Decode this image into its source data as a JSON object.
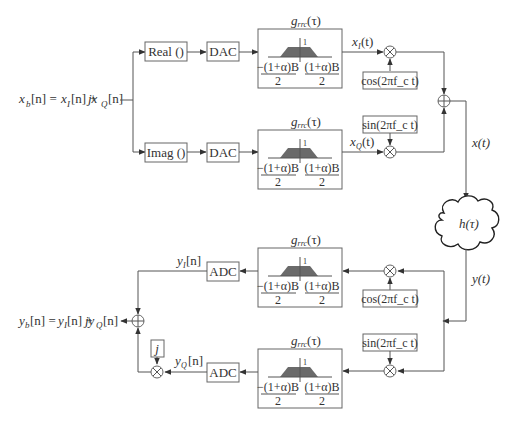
{
  "diagram": {
    "transmitter": {
      "input_label": "x_b[n] = x_I[n] + jx_Q[n]",
      "input_parts": {
        "main": "x",
        "sub_b": "b",
        "eq": "[n] = ",
        "xI": "x",
        "sub_I": "I",
        "mid": "[n] + ",
        "j": "jx",
        "sub_Q": "Q",
        "end": "[n]"
      },
      "real_block": "Real ()",
      "imag_block": "Imag ()",
      "dac_label": "DAC",
      "filter_title": "g_rrc(τ)",
      "filter_title_parts": {
        "g": "g",
        "sub": "rrc",
        "arg": "(τ)"
      },
      "filter_peak": "1",
      "filter_left_num": "−(1+α)B",
      "filter_right_num": "(1+α)B",
      "filter_den": "2",
      "xI_label": "x_I(t)",
      "xQ_label": "x_Q(t)",
      "cos_block": "cos(2πf_c t)",
      "sin_block": "sin(2πf_c t)",
      "output_label": "x(t)"
    },
    "channel": {
      "label": "h(τ)"
    },
    "receiver": {
      "input_label": "y(t)",
      "cos_block": "cos(2πf_c t)",
      "sin_block": "sin(2πf_c t)",
      "adc_label": "ADC",
      "yI_label": "y_I[n]",
      "yQ_label": "y_Q[n]",
      "j_block": "j",
      "output_label": "y_b[n] = y_I[n] + jy_Q[n]"
    },
    "colors": {
      "line": "#555555",
      "filter_fill": "#6a6a6a",
      "text": "#333333",
      "background": "#ffffff"
    }
  }
}
